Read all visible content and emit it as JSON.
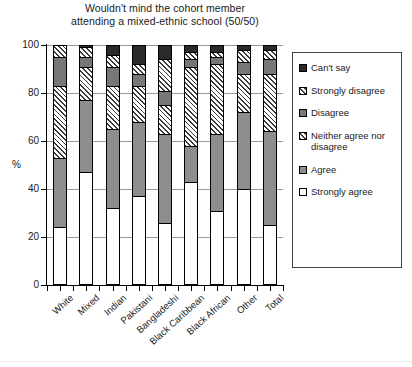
{
  "chart_data": {
    "type": "bar",
    "subtype": "stacked-bar-100",
    "title": "Wouldn't mind the cohort member attending a mixed-ethnic school (50/50)",
    "title_lines": [
      "Wouldn't mind the cohort member",
      "attending a mixed-ethnic school (50/50)"
    ],
    "xlabel": "",
    "ylabel": "%",
    "ylim": [
      0,
      100
    ],
    "yticks": [
      0,
      20,
      40,
      60,
      80,
      100
    ],
    "ytick_labels": [
      "0",
      "20",
      "40",
      "60",
      "80",
      "100"
    ],
    "grid": true,
    "grid_axis": "y",
    "legend_position": "right",
    "categories": [
      "White",
      "Mixed",
      "Indian",
      "Pakistani",
      "Bangladeshi",
      "Black Caribbean",
      "Black African",
      "Other",
      "Total"
    ],
    "series": [
      {
        "name": "Strongly agree",
        "pattern": "solid-white",
        "color": "#ffffff",
        "values": [
          24,
          47,
          32,
          37,
          26,
          43,
          31,
          40,
          25
        ]
      },
      {
        "name": "Agree",
        "pattern": "solid-gray",
        "color": "#8d8d8d",
        "values": [
          29,
          30,
          33,
          31,
          37,
          15,
          32,
          32,
          39
        ]
      },
      {
        "name": "Neither agree nor disagree",
        "pattern": "diagonal-hatch",
        "color": "#ffffff",
        "values": [
          30,
          14,
          18,
          15,
          12,
          33,
          29,
          16,
          24
        ]
      },
      {
        "name": "Disagree",
        "pattern": "solid-dark-gray",
        "color": "#777777",
        "values": [
          12,
          4,
          8,
          5,
          6,
          3,
          3,
          5,
          6
        ]
      },
      {
        "name": "Strongly disagree",
        "pattern": "diagonal-hatch",
        "color": "#ffffff",
        "values": [
          5,
          4,
          5,
          4,
          13,
          3,
          2,
          5,
          4
        ]
      },
      {
        "name": "Can't say",
        "pattern": "solid-black",
        "color": "#2a2a2a",
        "values": [
          0,
          1,
          4,
          8,
          6,
          3,
          3,
          2,
          2
        ]
      }
    ]
  },
  "legend": {
    "items": [
      {
        "label": "Can't say",
        "swatch": "cant-say"
      },
      {
        "label": "Strongly disagree",
        "swatch": "strongly-disagree"
      },
      {
        "label": "Disagree",
        "swatch": "disagree"
      },
      {
        "label": "Neither agree nor disagree",
        "swatch": "neither"
      },
      {
        "label": "Agree",
        "swatch": "agree"
      },
      {
        "label": "Strongly agree",
        "swatch": "strongly-agree"
      }
    ]
  }
}
